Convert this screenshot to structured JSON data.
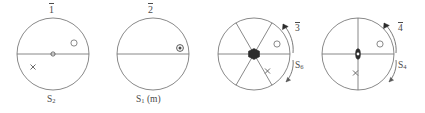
{
  "figure": {
    "type": "crystallographic-stereographic-projections",
    "background": "#ffffff",
    "stroke_color": "#6b6b6b",
    "text_color": "#4a4a4a",
    "width": 425,
    "height": 113
  },
  "panels": [
    {
      "id": "panel-1",
      "top_label": "1",
      "top_label_overbar": true,
      "bottom_label": "S",
      "bottom_label_sub": "2",
      "side_label": "",
      "side_label_sub": "",
      "side_label_overbar_text": "",
      "center_symbol": "open-circle-small",
      "diameters": [
        "horizontal"
      ],
      "sector_count": 2,
      "markers": [
        {
          "type": "open-circle",
          "position": "upper-right"
        },
        {
          "type": "cross",
          "position": "lower-left"
        }
      ],
      "arrow": false
    },
    {
      "id": "panel-2",
      "top_label": "2",
      "top_label_overbar": true,
      "bottom_label": "S",
      "bottom_label_sub": "1",
      "bottom_label_suffix": " (m)",
      "side_label": "",
      "side_label_sub": "",
      "side_label_overbar_text": "",
      "center_symbol": "none",
      "diameters": [
        "horizontal"
      ],
      "sector_count": 2,
      "markers": [
        {
          "type": "circled-dot",
          "position": "right-on-diameter"
        }
      ],
      "arrow": false
    },
    {
      "id": "panel-3",
      "top_label": "",
      "top_label_overbar": false,
      "bottom_label": "",
      "bottom_label_sub": "",
      "side_label_overbar_text": "3",
      "side_label": "S",
      "side_label_sub": "6",
      "center_symbol": "filled-hexagon",
      "diameters": [
        "horizontal",
        "diagonal-60",
        "diagonal-120"
      ],
      "sector_count": 6,
      "markers": [
        {
          "type": "open-circle",
          "position": "right"
        },
        {
          "type": "cross",
          "position": "lower-right"
        }
      ],
      "arrow": true,
      "arrow_direction": "counterclockwise-top-right"
    },
    {
      "id": "panel-4",
      "top_label": "",
      "top_label_overbar": false,
      "bottom_label": "",
      "bottom_label_sub": "",
      "side_label_overbar_text": "4",
      "side_label": "S",
      "side_label_sub": "4",
      "center_symbol": "filled-lens",
      "diameters": [
        "horizontal",
        "vertical"
      ],
      "sector_count": 4,
      "markers": [
        {
          "type": "open-circle",
          "position": "right"
        },
        {
          "type": "cross",
          "position": "lower-center"
        }
      ],
      "arrow": true,
      "arrow_direction": "counterclockwise-top-right"
    }
  ]
}
